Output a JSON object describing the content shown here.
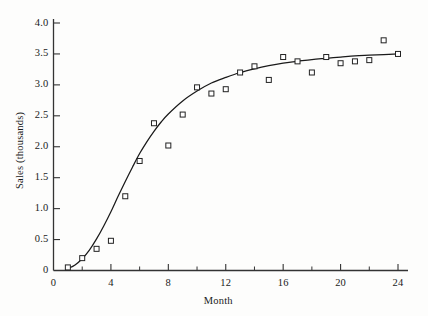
{
  "chart_data": {
    "type": "scatter",
    "title": "",
    "subtitle": "",
    "xlabel": "Month",
    "ylabel": "Sales (thousands)",
    "xlim": [
      0,
      25
    ],
    "ylim": [
      0,
      4.15
    ],
    "grid": false,
    "legend": null,
    "xticks": [
      0,
      4,
      8,
      12,
      16,
      20,
      24
    ],
    "xtick_labels": [
      "0",
      "4",
      "8",
      "12",
      "16",
      "20",
      "24"
    ],
    "xminor_ticks": [
      2,
      6,
      10,
      14,
      18,
      22
    ],
    "yticks": [
      0,
      0.5,
      1.0,
      1.5,
      2.0,
      2.5,
      3.0,
      3.5,
      4.0
    ],
    "ytick_labels": [
      "0",
      "0.5",
      "1.0",
      "1.5",
      "2.0",
      "2.5",
      "3.0",
      "3.5",
      "4.0"
    ],
    "marker": "open-square",
    "marker_color": "#222222",
    "marker_fill": "#ffffff",
    "line_color": "#1a1a1a",
    "axis_color": "#333333",
    "series": [
      {
        "name": "Observed sales",
        "type": "scatter",
        "x": [
          1,
          2,
          3,
          4,
          5,
          6,
          7,
          8,
          9,
          10,
          11,
          12,
          13,
          14,
          15,
          16,
          17,
          18,
          19,
          20,
          21,
          22,
          23,
          24
        ],
        "values": [
          0.05,
          0.2,
          0.35,
          0.48,
          1.2,
          1.77,
          2.38,
          2.02,
          2.52,
          2.96,
          2.86,
          2.93,
          3.2,
          3.3,
          3.08,
          3.45,
          3.38,
          3.2,
          3.45,
          3.35,
          3.38,
          3.4,
          3.72,
          3.5
        ]
      },
      {
        "name": "Fitted growth curve",
        "type": "line",
        "x": [
          1.0,
          1.5,
          2.0,
          2.5,
          3.0,
          3.5,
          4.0,
          4.5,
          5.0,
          5.5,
          6.0,
          6.5,
          7.0,
          7.5,
          8.0,
          9.0,
          10.0,
          11.0,
          12.0,
          13.0,
          14.0,
          15.0,
          16.0,
          17.0,
          18.0,
          19.0,
          20.0,
          21.0,
          22.0,
          23.0,
          24.0
        ],
        "values": [
          0.03,
          0.09,
          0.19,
          0.33,
          0.51,
          0.72,
          0.95,
          1.2,
          1.44,
          1.67,
          1.89,
          2.08,
          2.25,
          2.4,
          2.53,
          2.74,
          2.9,
          3.03,
          3.12,
          3.2,
          3.26,
          3.31,
          3.35,
          3.38,
          3.41,
          3.43,
          3.45,
          3.47,
          3.48,
          3.49,
          3.5
        ]
      }
    ]
  },
  "axes": {
    "x_title": "Month",
    "y_title": "Sales (thousands)"
  }
}
